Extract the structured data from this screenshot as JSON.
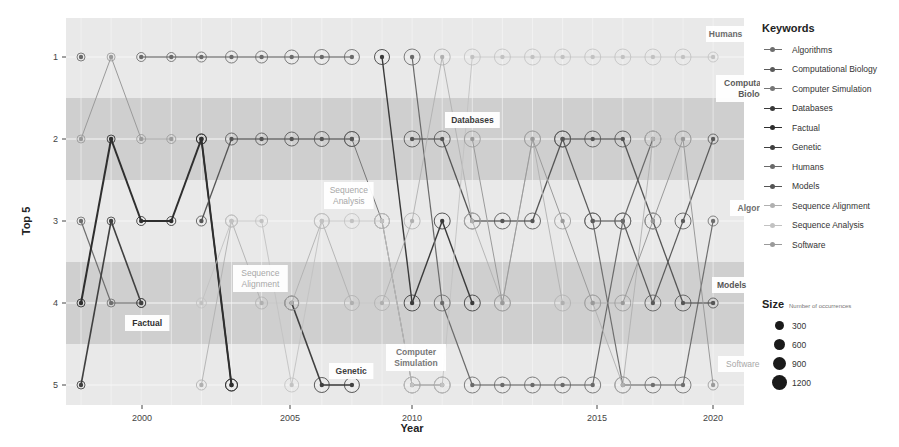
{
  "chart_data": {
    "type": "line",
    "title": "",
    "xlabel": "Year",
    "ylabel": "Top 5",
    "x_ticks": [
      2000,
      2005,
      2010,
      2015,
      2020
    ],
    "y_ticks": [
      1,
      2,
      3,
      4,
      5
    ],
    "xlim": [
      1997.5,
      2020
    ],
    "ylim": [
      5,
      1
    ],
    "y_reversed": true,
    "grid": true,
    "legend_position": "right",
    "bands": [
      {
        "from": 1.5,
        "to": 2.5
      },
      {
        "from": 3.5,
        "to": 4.5
      }
    ],
    "legend_title": "Keywords",
    "size_legend": {
      "title": "Size",
      "subtitle": "Number of occurrences",
      "values": [
        300,
        600,
        900,
        1200
      ]
    },
    "series": [
      {
        "name": "Algorithms",
        "color": "#6e6e6e",
        "width": 1.2,
        "points": [
          [
            1998,
            3
          ],
          [
            1999,
            4
          ],
          [
            2000,
            4
          ],
          [
            2015,
            3
          ],
          [
            2016,
            5
          ],
          [
            2017,
            5
          ],
          [
            2018,
            5
          ],
          [
            2019,
            3
          ]
        ],
        "label": {
          "text": "Algorithms",
          "x": 730,
          "y": 200
        }
      },
      {
        "name": "Computational Biology",
        "color": "#5a5a5a",
        "width": 1.2,
        "points": [
          [
            2014,
            2
          ],
          [
            2015,
            3
          ],
          [
            2016,
            3
          ],
          [
            2017,
            4
          ],
          [
            2018,
            3
          ],
          [
            2019,
            2
          ]
        ],
        "label": {
          "text": "Computational\nBiology",
          "x": 716,
          "y": 75
        }
      },
      {
        "name": "Computer Simulation",
        "color": "#777777",
        "width": 1.0,
        "points": [
          [
            2007,
            2
          ],
          [
            2008,
            3
          ],
          [
            2009,
            5
          ],
          [
            2010,
            5
          ]
        ],
        "label": {
          "text": "Computer\nSimulation",
          "x": 386,
          "y": 344
        }
      },
      {
        "name": "Databases",
        "color": "#3a3a3a",
        "width": 1.4,
        "points": [
          [
            2002,
            2
          ],
          [
            2003,
            5
          ],
          [
            2008,
            1
          ],
          [
            2009,
            4
          ],
          [
            2010,
            3
          ],
          [
            2011,
            4
          ]
        ],
        "label": {
          "text": "Databases",
          "x": 445,
          "y": 112
        }
      },
      {
        "name": "Factual",
        "color": "#2e2e2e",
        "width": 2.0,
        "points": [
          [
            1998,
            4
          ],
          [
            1999,
            2
          ],
          [
            2000,
            3
          ],
          [
            2001,
            3
          ],
          [
            2002,
            2
          ],
          [
            2003,
            5
          ]
        ],
        "label": {
          "text": "Factual",
          "x": 125,
          "y": 315
        }
      },
      {
        "name": "Genetic",
        "color": "#404040",
        "width": 1.6,
        "points": [
          [
            1998,
            5
          ],
          [
            1999,
            3
          ],
          [
            2000,
            4
          ],
          [
            2005,
            4
          ],
          [
            2006,
            5
          ],
          [
            2007,
            5
          ]
        ],
        "label": {
          "text": "Genetic",
          "x": 329,
          "y": 363
        }
      },
      {
        "name": "Humans",
        "color": "#6a6a6a",
        "width": 1.2,
        "points": [
          [
            1998,
            1
          ],
          [
            2000,
            1
          ],
          [
            2001,
            1
          ],
          [
            2002,
            1
          ],
          [
            2003,
            1
          ],
          [
            2004,
            1
          ],
          [
            2005,
            1
          ],
          [
            2006,
            1
          ],
          [
            2007,
            1
          ],
          [
            2009,
            1
          ],
          [
            2010,
            4
          ],
          [
            2011,
            5
          ],
          [
            2012,
            5
          ],
          [
            2013,
            5
          ],
          [
            2014,
            5
          ],
          [
            2015,
            5
          ],
          [
            2016,
            3
          ],
          [
            2017,
            2
          ]
        ],
        "label": {
          "text": "Humans",
          "x": 706,
          "y": 26
        }
      },
      {
        "name": "Models",
        "color": "#555555",
        "width": 1.3,
        "points": [
          [
            2002,
            3
          ],
          [
            2003,
            2
          ],
          [
            2004,
            2
          ],
          [
            2005,
            2
          ],
          [
            2006,
            2
          ],
          [
            2007,
            2
          ],
          [
            2009,
            2
          ],
          [
            2010,
            2
          ],
          [
            2011,
            3
          ],
          [
            2012,
            3
          ],
          [
            2013,
            3
          ],
          [
            2014,
            2
          ],
          [
            2015,
            2
          ],
          [
            2016,
            2
          ],
          [
            2017,
            3
          ],
          [
            2018,
            4
          ],
          [
            2019,
            4
          ]
        ],
        "label": {
          "text": "Models",
          "x": 712,
          "y": 277
        }
      },
      {
        "name": "Sequence Alignment",
        "color": "#b0b0b0",
        "width": 0.9,
        "points": [
          [
            2002,
            5
          ],
          [
            2003,
            3
          ],
          [
            2004,
            4
          ],
          [
            2005,
            4
          ],
          [
            2006,
            3
          ],
          [
            2007,
            4
          ],
          [
            2008,
            4
          ],
          [
            2009,
            3
          ],
          [
            2010,
            1
          ],
          [
            2011,
            3
          ],
          [
            2012,
            4
          ],
          [
            2013,
            2
          ],
          [
            2014,
            4
          ],
          [
            2015,
            4
          ],
          [
            2016,
            5
          ],
          [
            2017,
            2
          ],
          [
            2018,
            2
          ]
        ],
        "label": {
          "text": "Sequence\nAlignment",
          "x": 233,
          "y": 265
        }
      },
      {
        "name": "Sequence Analysis",
        "color": "#c2c2c2",
        "width": 0.9,
        "points": [
          [
            2002,
            4
          ],
          [
            2003,
            3
          ],
          [
            2004,
            3
          ],
          [
            2005,
            5
          ],
          [
            2006,
            3
          ],
          [
            2007,
            3
          ],
          [
            2008,
            3
          ],
          [
            2009,
            5
          ],
          [
            2010,
            5
          ],
          [
            2011,
            1
          ],
          [
            2012,
            1
          ],
          [
            2013,
            1
          ],
          [
            2014,
            1
          ],
          [
            2015,
            1
          ],
          [
            2016,
            1
          ],
          [
            2017,
            1
          ],
          [
            2018,
            1
          ],
          [
            2019,
            1
          ]
        ],
        "label": {
          "text": "Sequence\nAnalysis",
          "x": 324,
          "y": 182
        }
      },
      {
        "name": "Software",
        "color": "#9a9a9a",
        "width": 1.0,
        "points": [
          [
            1998,
            2
          ],
          [
            1999,
            1
          ],
          [
            2000,
            2
          ],
          [
            2001,
            2
          ],
          [
            2011,
            2
          ],
          [
            2012,
            4
          ],
          [
            2013,
            2
          ],
          [
            2014,
            3
          ],
          [
            2015,
            4
          ],
          [
            2016,
            4
          ],
          [
            2017,
            3
          ],
          [
            2018,
            2
          ],
          [
            2019,
            5
          ]
        ],
        "label": {
          "text": "Software",
          "x": 718,
          "y": 356
        }
      }
    ],
    "point_sizes": {
      "1998": 4,
      "1999": 4,
      "2000": 4.5,
      "2001": 4.5,
      "2002": 5,
      "2003": 6,
      "2004": 6,
      "2005": 7,
      "2006": 7.5,
      "2007": 7.5,
      "2008": 7.5,
      "2009": 8,
      "2010": 8,
      "2011": 8,
      "2012": 8,
      "2013": 8,
      "2014": 8,
      "2015": 8,
      "2016": 8,
      "2017": 8,
      "2018": 8,
      "2019": 5
    }
  },
  "axis": {
    "y_title": "Top 5",
    "x_title": "Year",
    "y_tick_labels": [
      "1",
      "2",
      "3",
      "4",
      "5"
    ],
    "x_tick_labels": [
      "2000",
      "2005",
      "2010",
      "2015",
      "2020"
    ]
  },
  "legend": {
    "title": "Keywords",
    "items": [
      {
        "label": "Algorithms",
        "color": "#6e6e6e"
      },
      {
        "label": "Computational Biology",
        "color": "#5a5a5a"
      },
      {
        "label": "Computer Simulation",
        "color": "#777777"
      },
      {
        "label": "Databases",
        "color": "#3a3a3a"
      },
      {
        "label": "Factual",
        "color": "#2e2e2e"
      },
      {
        "label": "Genetic",
        "color": "#404040"
      },
      {
        "label": "Humans",
        "color": "#6a6a6a"
      },
      {
        "label": "Models",
        "color": "#555555"
      },
      {
        "label": "Sequence Alignment",
        "color": "#b0b0b0"
      },
      {
        "label": "Sequence Analysis",
        "color": "#c2c2c2"
      },
      {
        "label": "Software",
        "color": "#9a9a9a"
      }
    ]
  },
  "size_legend": {
    "title": "Size",
    "subtitle": "Number of occurrences",
    "items": [
      {
        "label": "300",
        "diameter": 9
      },
      {
        "label": "600",
        "diameter": 11
      },
      {
        "label": "900",
        "diameter": 13
      },
      {
        "label": "1200",
        "diameter": 15
      }
    ]
  },
  "colors": {
    "panel_light": "#e9e9e9",
    "band_dark": "#cfcfcf",
    "grid": "#f7f7f7"
  }
}
